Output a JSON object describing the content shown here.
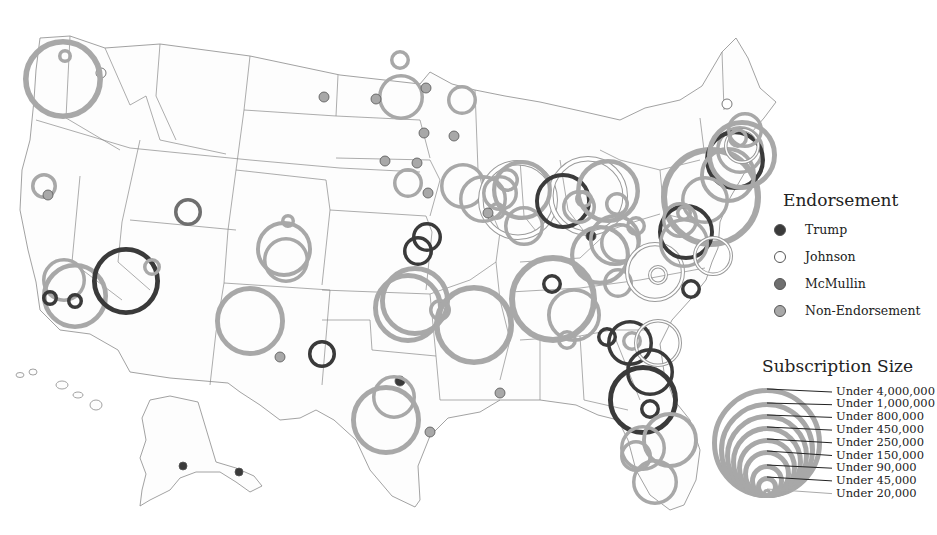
{
  "colors": {
    "trump": "#3a3a3a",
    "johnson": "#ffffff",
    "mcmullin": "#6f6f6f",
    "non_endorsement": "#a8a8a8",
    "state_border": "#8a8a8a"
  },
  "legend": {
    "endorsement": {
      "title": "Endorsement",
      "items": [
        {
          "label": "Trump",
          "key": "trump"
        },
        {
          "label": "Johnson",
          "key": "johnson"
        },
        {
          "label": "McMullin",
          "key": "mcmullin"
        },
        {
          "label": "Non-Endorsement",
          "key": "non_endorsement"
        }
      ]
    },
    "size": {
      "title": "Subscription Size",
      "tiers": [
        "Under 4,000,000",
        "Under 1,000,000",
        "Under 800,000",
        "Under 450,000",
        "Under 250,000",
        "Under 150,000",
        "Under 90,000",
        "Under 45,000",
        "Under 20,000"
      ]
    }
  },
  "markers": [
    {
      "x": 65,
      "y": 56,
      "r": 7,
      "cat": "non_endorsement"
    },
    {
      "x": 101,
      "y": 73,
      "r": 5,
      "cat": "johnson"
    },
    {
      "x": 63,
      "y": 79,
      "r": 40,
      "cat": "non_endorsement"
    },
    {
      "x": 44,
      "y": 186,
      "r": 13,
      "cat": "non_endorsement"
    },
    {
      "x": 48,
      "y": 195,
      "r": 5,
      "cat": "non_endorsement"
    },
    {
      "x": 64,
      "y": 280,
      "r": 22,
      "cat": "non_endorsement"
    },
    {
      "x": 75,
      "y": 296,
      "r": 33,
      "cat": "non_endorsement"
    },
    {
      "x": 50,
      "y": 298,
      "r": 8,
      "cat": "trump"
    },
    {
      "x": 75,
      "y": 301,
      "r": 8,
      "cat": "trump"
    },
    {
      "x": 126,
      "y": 281,
      "r": 34,
      "cat": "trump"
    },
    {
      "x": 152,
      "y": 267,
      "r": 9,
      "cat": "non_endorsement"
    },
    {
      "x": 188,
      "y": 212,
      "r": 14,
      "cat": "mcmullin"
    },
    {
      "x": 288,
      "y": 221,
      "r": 7,
      "cat": "non_endorsement"
    },
    {
      "x": 284,
      "y": 249,
      "r": 28,
      "cat": "non_endorsement"
    },
    {
      "x": 286,
      "y": 260,
      "r": 23,
      "cat": "non_endorsement"
    },
    {
      "x": 250,
      "y": 321,
      "r": 35,
      "cat": "non_endorsement"
    },
    {
      "x": 280,
      "y": 357,
      "r": 5,
      "cat": "non_endorsement"
    },
    {
      "x": 322,
      "y": 354,
      "r": 14,
      "cat": "trump"
    },
    {
      "x": 400,
      "y": 60,
      "r": 10,
      "cat": "non_endorsement"
    },
    {
      "x": 401,
      "y": 97,
      "r": 23,
      "cat": "non_endorsement"
    },
    {
      "x": 376,
      "y": 99,
      "r": 5,
      "cat": "non_endorsement"
    },
    {
      "x": 426,
      "y": 88,
      "r": 5,
      "cat": "non_endorsement"
    },
    {
      "x": 462,
      "y": 100,
      "r": 15,
      "cat": "non_endorsement"
    },
    {
      "x": 324,
      "y": 97,
      "r": 5,
      "cat": "non_endorsement"
    },
    {
      "x": 424,
      "y": 133,
      "r": 5,
      "cat": "non_endorsement"
    },
    {
      "x": 454,
      "y": 136,
      "r": 5,
      "cat": "non_endorsement"
    },
    {
      "x": 385,
      "y": 161,
      "r": 5,
      "cat": "non_endorsement"
    },
    {
      "x": 417,
      "y": 163,
      "r": 5,
      "cat": "non_endorsement"
    },
    {
      "x": 408,
      "y": 183,
      "r": 15,
      "cat": "non_endorsement"
    },
    {
      "x": 428,
      "y": 193,
      "r": 5,
      "cat": "non_endorsement"
    },
    {
      "x": 463,
      "y": 186,
      "r": 23,
      "cat": "non_endorsement"
    },
    {
      "x": 427,
      "y": 237,
      "r": 15,
      "cat": "trump"
    },
    {
      "x": 418,
      "y": 251,
      "r": 15,
      "cat": "trump"
    },
    {
      "x": 408,
      "y": 308,
      "r": 35,
      "cat": "non_endorsement"
    },
    {
      "x": 415,
      "y": 301,
      "r": 35,
      "cat": "non_endorsement"
    },
    {
      "x": 440,
      "y": 310,
      "r": 11,
      "cat": "non_endorsement"
    },
    {
      "x": 474,
      "y": 325,
      "r": 40,
      "cat": "non_endorsement"
    },
    {
      "x": 400,
      "y": 381,
      "r": 5,
      "cat": "trump"
    },
    {
      "x": 394,
      "y": 397,
      "r": 22,
      "cat": "non_endorsement"
    },
    {
      "x": 386,
      "y": 420,
      "r": 35,
      "cat": "non_endorsement"
    },
    {
      "x": 430,
      "y": 432,
      "r": 5,
      "cat": "non_endorsement"
    },
    {
      "x": 500,
      "y": 393,
      "r": 5,
      "cat": "non_endorsement"
    },
    {
      "x": 518,
      "y": 200,
      "r": 40,
      "cat": "johnson"
    },
    {
      "x": 588,
      "y": 196,
      "r": 40,
      "cat": "johnson"
    },
    {
      "x": 483,
      "y": 199,
      "r": 24,
      "cat": "non_endorsement"
    },
    {
      "x": 507,
      "y": 180,
      "r": 12,
      "cat": "non_endorsement"
    },
    {
      "x": 500,
      "y": 193,
      "r": 18,
      "cat": "non_endorsement"
    },
    {
      "x": 522,
      "y": 190,
      "r": 30,
      "cat": "non_endorsement"
    },
    {
      "x": 497,
      "y": 211,
      "r": 9,
      "cat": "non_endorsement"
    },
    {
      "x": 524,
      "y": 226,
      "r": 20,
      "cat": "non_endorsement"
    },
    {
      "x": 488,
      "y": 213,
      "r": 5,
      "cat": "non_endorsement"
    },
    {
      "x": 563,
      "y": 201,
      "r": 28,
      "cat": "trump"
    },
    {
      "x": 579,
      "y": 207,
      "r": 17,
      "cat": "non_endorsement"
    },
    {
      "x": 584,
      "y": 199,
      "r": 9,
      "cat": "non_endorsement"
    },
    {
      "x": 608,
      "y": 191,
      "r": 32,
      "cat": "non_endorsement"
    },
    {
      "x": 617,
      "y": 204,
      "r": 12,
      "cat": "non_endorsement"
    },
    {
      "x": 591,
      "y": 236,
      "r": 5,
      "cat": "trump"
    },
    {
      "x": 615,
      "y": 240,
      "r": 26,
      "cat": "non_endorsement"
    },
    {
      "x": 620,
      "y": 243,
      "r": 20,
      "cat": "non_endorsement"
    },
    {
      "x": 636,
      "y": 226,
      "r": 10,
      "cat": "non_endorsement"
    },
    {
      "x": 600,
      "y": 255,
      "r": 30,
      "cat": "non_endorsement"
    },
    {
      "x": 552,
      "y": 284,
      "r": 10,
      "cat": "trump"
    },
    {
      "x": 553,
      "y": 299,
      "r": 44,
      "cat": "non_endorsement"
    },
    {
      "x": 574,
      "y": 315,
      "r": 27,
      "cat": "non_endorsement"
    },
    {
      "x": 567,
      "y": 340,
      "r": 10,
      "cat": "non_endorsement"
    },
    {
      "x": 618,
      "y": 283,
      "r": 15,
      "cat": "non_endorsement"
    },
    {
      "x": 655,
      "y": 272,
      "r": 30,
      "cat": "johnson"
    },
    {
      "x": 658,
      "y": 275,
      "r": 10,
      "cat": "johnson"
    },
    {
      "x": 691,
      "y": 289,
      "r": 10,
      "cat": "trump"
    },
    {
      "x": 607,
      "y": 337,
      "r": 10,
      "cat": "trump"
    },
    {
      "x": 630,
      "y": 343,
      "r": 23,
      "cat": "trump"
    },
    {
      "x": 632,
      "y": 341,
      "r": 10,
      "cat": "non_endorsement"
    },
    {
      "x": 658,
      "y": 343,
      "r": 24,
      "cat": "johnson"
    },
    {
      "x": 650,
      "y": 372,
      "r": 24,
      "cat": "trump"
    },
    {
      "x": 643,
      "y": 400,
      "r": 35,
      "cat": "trump"
    },
    {
      "x": 650,
      "y": 409,
      "r": 10,
      "cat": "trump"
    },
    {
      "x": 670,
      "y": 440,
      "r": 28,
      "cat": "non_endorsement"
    },
    {
      "x": 643,
      "y": 448,
      "r": 23,
      "cat": "non_endorsement"
    },
    {
      "x": 636,
      "y": 456,
      "r": 16,
      "cat": "non_endorsement"
    },
    {
      "x": 655,
      "y": 482,
      "r": 23,
      "cat": "non_endorsement"
    },
    {
      "x": 711,
      "y": 197,
      "r": 50,
      "cat": "non_endorsement"
    },
    {
      "x": 740,
      "y": 150,
      "r": 24,
      "cat": "non_endorsement"
    },
    {
      "x": 735,
      "y": 160,
      "r": 30,
      "cat": "trump"
    },
    {
      "x": 728,
      "y": 175,
      "r": 28,
      "cat": "non_endorsement"
    },
    {
      "x": 705,
      "y": 200,
      "r": 24,
      "cat": "non_endorsement"
    },
    {
      "x": 742,
      "y": 146,
      "r": 18,
      "cat": "johnson"
    },
    {
      "x": 738,
      "y": 138,
      "r": 10,
      "cat": "non_endorsement"
    },
    {
      "x": 742,
      "y": 155,
      "r": 35,
      "cat": "non_endorsement"
    },
    {
      "x": 745,
      "y": 130,
      "r": 18,
      "cat": "non_endorsement"
    },
    {
      "x": 727,
      "y": 104,
      "r": 5,
      "cat": "johnson"
    },
    {
      "x": 686,
      "y": 232,
      "r": 28,
      "cat": "trump"
    },
    {
      "x": 684,
      "y": 213,
      "r": 8,
      "cat": "non_endorsement"
    },
    {
      "x": 684,
      "y": 243,
      "r": 25,
      "cat": "non_endorsement"
    },
    {
      "x": 680,
      "y": 220,
      "r": 18,
      "cat": "non_endorsement"
    },
    {
      "x": 713,
      "y": 256,
      "r": 20,
      "cat": "johnson"
    },
    {
      "x": 183,
      "y": 466,
      "r": 4,
      "cat": "trump"
    },
    {
      "x": 239,
      "y": 472,
      "r": 4,
      "cat": "trump"
    }
  ],
  "size_legend": {
    "cx": 767,
    "bottom": 498,
    "radii": [
      55,
      48,
      42,
      36,
      30,
      24,
      17,
      11,
      5
    ]
  }
}
